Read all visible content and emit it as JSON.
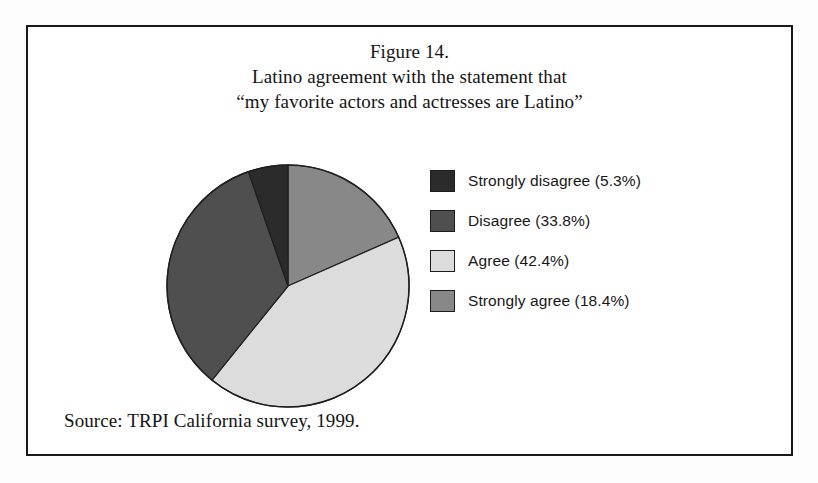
{
  "figure": {
    "caption_lines": [
      "Figure 14.",
      "Latino agreement with the statement that",
      "“my favorite actors and actresses are Latino”"
    ],
    "source_note": "Source: TRPI California survey, 1999."
  },
  "chart_data": {
    "type": "pie",
    "title": "Latino agreement with the statement that “my favorite actors and actresses are Latino”",
    "xlabel": "",
    "ylabel": "",
    "units": "percent",
    "start_angle_deg": 0,
    "direction": "clockwise",
    "legend_position": "right",
    "grid": false,
    "categories": [
      "Strongly disagree",
      "Disagree",
      "Agree",
      "Strongly agree"
    ],
    "values": [
      5.3,
      33.8,
      42.4,
      18.4
    ],
    "colors": [
      "#2b2b2b",
      "#4f4f4f",
      "#dcdcdc",
      "#888888"
    ],
    "slices": [
      {
        "label": "Strongly disagree",
        "value": 5.3,
        "legend_text": "Strongly disagree (5.3%)",
        "color": "#2b2b2b",
        "draw_order": 4,
        "start_deg": 340.9,
        "end_deg": 360.0
      },
      {
        "label": "Disagree",
        "value": 33.8,
        "legend_text": "Disagree (33.8%)",
        "color": "#4f4f4f",
        "draw_order": 3,
        "start_deg": 218.9,
        "end_deg": 340.9
      },
      {
        "label": "Agree",
        "value": 42.4,
        "legend_text": "Agree (42.4%)",
        "color": "#dcdcdc",
        "draw_order": 2,
        "start_deg": 66.2,
        "end_deg": 218.9
      },
      {
        "label": "Strongly agree",
        "value": 18.4,
        "legend_text": "Strongly agree (18.4%)",
        "color": "#888888",
        "draw_order": 1,
        "start_deg": 0.0,
        "end_deg": 66.2
      }
    ]
  },
  "legend": {
    "items": [
      {
        "label": "Strongly disagree (5.3%)",
        "color": "#2b2b2b"
      },
      {
        "label": "Disagree (33.8%)",
        "color": "#4f4f4f"
      },
      {
        "label": "Agree (42.4%)",
        "color": "#dcdcdc"
      },
      {
        "label": "Strongly agree (18.4%)",
        "color": "#888888"
      }
    ]
  }
}
